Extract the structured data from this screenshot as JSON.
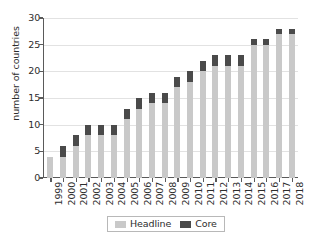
{
  "chart_data": {
    "type": "bar",
    "stacked": true,
    "title": "",
    "subtitle": "",
    "xlabel": "",
    "ylabel": "number of countries",
    "ylim": [
      0,
      30
    ],
    "yticks": [
      0,
      5,
      10,
      15,
      20,
      25,
      30
    ],
    "ytick_labels": [
      "0",
      "5",
      "10",
      "15",
      "20",
      "25",
      "30"
    ],
    "grid": true,
    "grid_axis": "y",
    "legend_position": "bottom",
    "categories": [
      "1999",
      "2000",
      "2001",
      "2002",
      "2003",
      "2004",
      "2005",
      "2006",
      "2007",
      "2008",
      "2009",
      "2010",
      "2011",
      "2012",
      "2013",
      "2014",
      "2015",
      "2016",
      "2017",
      "2018"
    ],
    "series": [
      {
        "name": "Headline",
        "color": "#c9c9c9",
        "values": [
          4,
          4,
          6,
          8,
          8,
          8,
          11,
          13,
          14,
          14,
          17,
          18,
          20,
          21,
          21,
          21,
          25,
          25,
          27,
          27
        ]
      },
      {
        "name": "Core",
        "color": "#4a4a4a",
        "values": [
          0,
          2,
          2,
          2,
          2,
          2,
          2,
          2,
          2,
          2,
          2,
          2,
          2,
          2,
          2,
          2,
          1,
          1,
          1,
          1
        ]
      }
    ],
    "totals": [
      4,
      6,
      8,
      10,
      10,
      10,
      13,
      15,
      16,
      16,
      19,
      20,
      22,
      23,
      23,
      23,
      26,
      26,
      28,
      28
    ]
  },
  "legend": {
    "items": [
      {
        "label": "Headline",
        "color": "#c9c9c9"
      },
      {
        "label": "Core",
        "color": "#4a4a4a"
      }
    ]
  },
  "colors": {
    "headline": "#c9c9c9",
    "core": "#4a4a4a",
    "axis": "#5a5a5a",
    "grid": "#e2e2e2",
    "text": "#2d2d2d",
    "background": "#ffffff",
    "legend_border": "#b8b8b8"
  }
}
